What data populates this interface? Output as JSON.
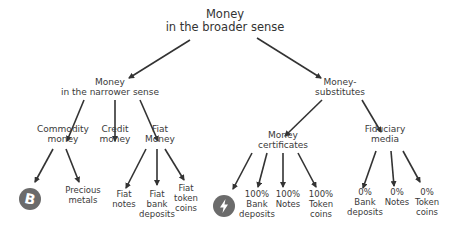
{
  "diagram": {
    "root": {
      "line1": "Money",
      "line2": "in the broader sense"
    },
    "narrower": {
      "line1": "Money",
      "line2": "in the narrower sense"
    },
    "substitutes": {
      "line1": "Money-",
      "line2": "substitutes"
    },
    "commodity": {
      "line1": "Commodity",
      "line2": "money"
    },
    "credit": {
      "line1": "Credit",
      "line2": "money"
    },
    "fiat": {
      "line1": "Fiat",
      "line2": "Money"
    },
    "bitcoin_icon": "bitcoin-icon",
    "precious": {
      "line1": "Precious",
      "line2": "metals"
    },
    "fiat_notes": {
      "line1": "Fiat",
      "line2": "notes"
    },
    "fiat_bank": {
      "line1": "Fiat",
      "line2": "bank",
      "line3": "deposits"
    },
    "fiat_token": {
      "line1": "Fiat",
      "line2": "token",
      "line3": "coins"
    },
    "certificates": {
      "line1": "Money",
      "line2": "certificates"
    },
    "fiduciary": {
      "line1": "Fiduciary",
      "line2": "media"
    },
    "lightning_icon": "lightning-icon",
    "cert_bank": {
      "line1": "100%",
      "line2": "Bank",
      "line3": "deposits"
    },
    "cert_notes": {
      "line1": "100%",
      "line2": "Notes"
    },
    "cert_token": {
      "line1": "100%",
      "line2": "Token",
      "line3": "coins"
    },
    "fid_bank": {
      "line1": "0%",
      "line2": "Bank",
      "line3": "deposits"
    },
    "fid_notes": {
      "line1": "0%",
      "line2": "Notes"
    },
    "fid_token": {
      "line1": "0%",
      "line2": "Token",
      "line3": "coins"
    },
    "colors": {
      "text": "#3a3a3a",
      "arrow": "#333333",
      "icon": "#6b6b6b"
    }
  }
}
